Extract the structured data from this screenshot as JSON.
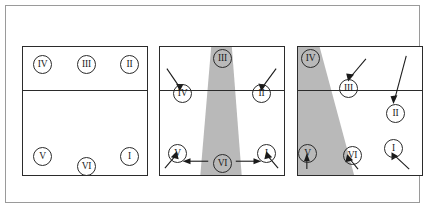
{
  "figure": {
    "background_color": "#ffffff",
    "frame_color": "#9a9a9a",
    "court_line_color": "#2b2b2b",
    "shade_color": "#b9b9b9",
    "panel_count": 3
  },
  "panels": [
    {
      "id": "panel-1",
      "label": "panel-1",
      "caption": "",
      "has_corridor": false,
      "players": [
        {
          "label": "IV",
          "x": 10,
          "y": 8,
          "zone": "front-left"
        },
        {
          "label": "III",
          "x": 54,
          "y": 8,
          "zone": "front-center"
        },
        {
          "label": "II",
          "x": 97,
          "y": 8,
          "zone": "front-right"
        },
        {
          "label": "V",
          "x": 10,
          "y": 100,
          "zone": "back-left"
        },
        {
          "label": "VI",
          "x": 54,
          "y": 110,
          "zone": "back-center"
        },
        {
          "label": "I",
          "x": 97,
          "y": 100,
          "zone": "back-right"
        }
      ],
      "arrows": []
    },
    {
      "id": "panel-2",
      "label": "panel-2",
      "caption": "",
      "has_corridor": true,
      "corridor_shape": "vertical-trapezoid-center",
      "players": [
        {
          "label": "III",
          "x": 53,
          "y": 2,
          "zone": "front-center"
        },
        {
          "label": "IV",
          "x": 13,
          "y": 37,
          "zone": "front-left"
        },
        {
          "label": "II",
          "x": 92,
          "y": 37,
          "zone": "front-right"
        },
        {
          "label": "V",
          "x": 8,
          "y": 97,
          "zone": "back-left"
        },
        {
          "label": "VI",
          "x": 53,
          "y": 110,
          "zone": "back-center"
        },
        {
          "label": "I",
          "x": 97,
          "y": 97,
          "zone": "back-right"
        }
      ],
      "arrows": [
        {
          "name": "arrow-to-IV",
          "direction": "down-right"
        },
        {
          "name": "arrow-to-II",
          "direction": "down-left"
        },
        {
          "name": "arrow-to-V",
          "direction": "up-right"
        },
        {
          "name": "arrow-to-I",
          "direction": "up-left"
        },
        {
          "name": "arrow-VI-left",
          "direction": "left"
        },
        {
          "name": "arrow-VI-right",
          "direction": "right"
        }
      ]
    },
    {
      "id": "panel-3",
      "label": "panel-3",
      "caption": "",
      "has_corridor": true,
      "corridor_shape": "slanted-band-left",
      "players": [
        {
          "label": "IV",
          "x": 3,
          "y": 2,
          "zone": "front-left"
        },
        {
          "label": "III",
          "x": 41,
          "y": 32,
          "zone": "front-center"
        },
        {
          "label": "II",
          "x": 88,
          "y": 57,
          "zone": "front-right"
        },
        {
          "label": "V",
          "x": 0,
          "y": 97,
          "zone": "back-left"
        },
        {
          "label": "VI",
          "x": 45,
          "y": 99,
          "zone": "back-center"
        },
        {
          "label": "I",
          "x": 86,
          "y": 92,
          "zone": "back-right"
        }
      ],
      "arrows": [
        {
          "name": "arrow-to-III",
          "direction": "down-left"
        },
        {
          "name": "arrow-to-II",
          "direction": "down"
        },
        {
          "name": "arrow-to-V",
          "direction": "up"
        },
        {
          "name": "arrow-to-VI",
          "direction": "up-left"
        },
        {
          "name": "arrow-to-I",
          "direction": "up-left"
        }
      ]
    }
  ]
}
